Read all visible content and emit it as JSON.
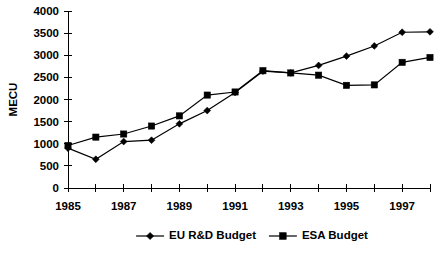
{
  "chart_data": {
    "type": "line",
    "title": "",
    "xlabel": "",
    "ylabel": "MECU",
    "x": [
      1985,
      1986,
      1987,
      1988,
      1989,
      1990,
      1991,
      1992,
      1993,
      1994,
      1995,
      1996,
      1997,
      1998
    ],
    "x_tick_labels": [
      "1985",
      "",
      "1987",
      "",
      "1989",
      "",
      "1991",
      "",
      "1993",
      "",
      "1995",
      "",
      "1997",
      ""
    ],
    "xlim": [
      1985,
      1998
    ],
    "ylim": [
      0,
      4000
    ],
    "y_ticks": [
      0,
      500,
      1000,
      1500,
      2000,
      2500,
      3000,
      3500,
      4000
    ],
    "y_tick_labels": [
      "0",
      "500",
      "1000",
      "1500",
      "2000",
      "2500",
      "3000",
      "3500",
      "4000"
    ],
    "grid": false,
    "legend_position": "bottom",
    "series": [
      {
        "name": "EU R&D Budget",
        "marker": "diamond",
        "color": "#000000",
        "values": [
          900,
          650,
          1050,
          1080,
          1450,
          1750,
          2160,
          2640,
          2600,
          2770,
          2980,
          3210,
          3520,
          3530
        ]
      },
      {
        "name": "ESA Budget",
        "marker": "square",
        "color": "#000000",
        "values": [
          960,
          1150,
          1220,
          1400,
          1630,
          2100,
          2170,
          2650,
          2600,
          2550,
          2320,
          2330,
          2840,
          2950
        ]
      }
    ]
  },
  "legend": {
    "items": [
      {
        "label": "EU R&D Budget",
        "marker": "diamond"
      },
      {
        "label": "ESA Budget",
        "marker": "square"
      }
    ]
  }
}
